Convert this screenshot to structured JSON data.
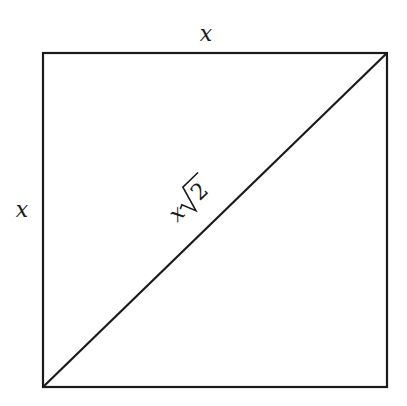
{
  "diagram": {
    "labels": {
      "top_side": "x",
      "left_side": "x",
      "diagonal_var": "x",
      "diagonal_radicand": "2"
    },
    "colors": {
      "stroke": "#1a1a1a",
      "background": "#ffffff"
    }
  }
}
